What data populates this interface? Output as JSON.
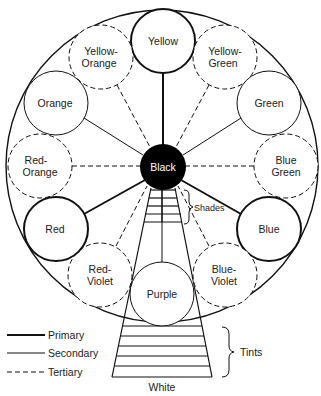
{
  "diagram": {
    "center": {
      "label": "Black",
      "fill": "#000000"
    },
    "bottom_label": "White",
    "shades_label": "Shades",
    "tints_label": "Tints",
    "colors": [
      {
        "label": "Yellow",
        "lines": [
          "Yellow"
        ],
        "type": "primary"
      },
      {
        "label": "Yellow-Green",
        "lines": [
          "Yellow-",
          "Green"
        ],
        "type": "tertiary"
      },
      {
        "label": "Green",
        "lines": [
          "Green"
        ],
        "type": "secondary"
      },
      {
        "label": "Blue Green",
        "lines": [
          "Blue",
          "Green"
        ],
        "type": "tertiary"
      },
      {
        "label": "Blue",
        "lines": [
          "Blue"
        ],
        "type": "primary"
      },
      {
        "label": "Blue-Violet",
        "lines": [
          "Blue-",
          "Violet"
        ],
        "type": "tertiary"
      },
      {
        "label": "Purple",
        "lines": [
          "Purple"
        ],
        "type": "secondary"
      },
      {
        "label": "Red-Violet",
        "lines": [
          "Red-",
          "Violet"
        ],
        "type": "tertiary"
      },
      {
        "label": "Red",
        "lines": [
          "Red"
        ],
        "type": "primary"
      },
      {
        "label": "Red-Orange",
        "lines": [
          "Red-",
          "Orange"
        ],
        "type": "tertiary"
      },
      {
        "label": "Orange",
        "lines": [
          "Orange"
        ],
        "type": "secondary"
      },
      {
        "label": "Yellow-Orange",
        "lines": [
          "Yellow-",
          "Orange"
        ],
        "type": "tertiary"
      }
    ],
    "legend": [
      {
        "label": "Primary",
        "style": "thick"
      },
      {
        "label": "Secondary",
        "style": "thin"
      },
      {
        "label": "Tertiary",
        "style": "dashed"
      }
    ]
  }
}
